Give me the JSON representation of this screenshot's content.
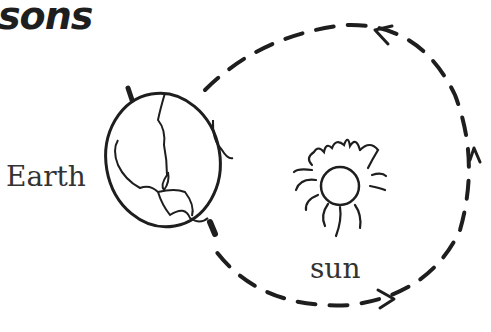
{
  "title": "sons",
  "labels": {
    "earth": "Earth",
    "sun": "sun"
  },
  "diagram": {
    "orbit_direction": "counter-clockwise",
    "stroke_color": "#1e1e1e"
  }
}
